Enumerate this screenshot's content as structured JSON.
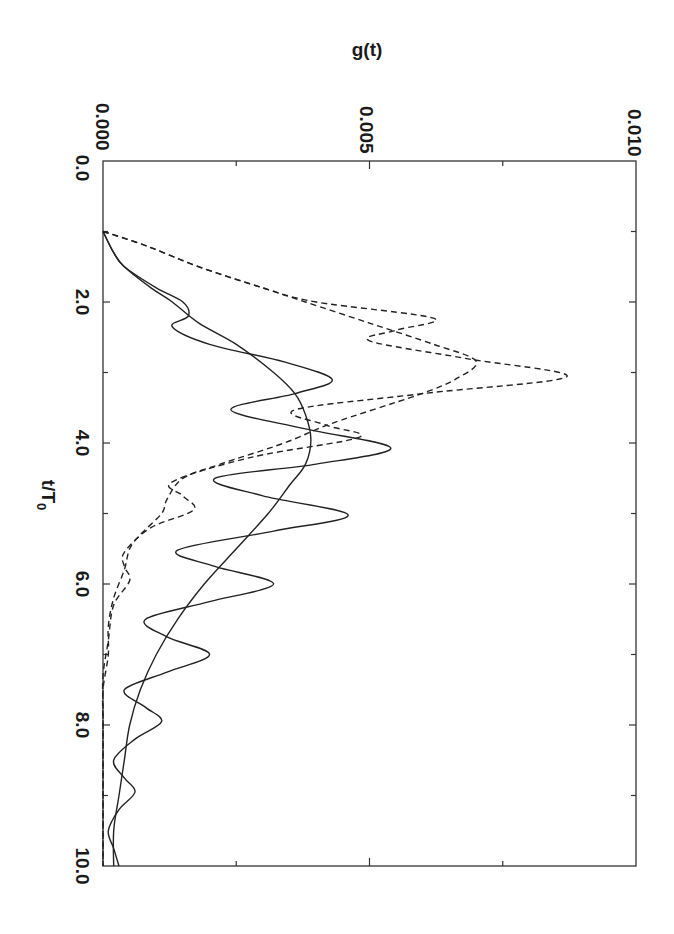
{
  "chart_data": {
    "type": "line",
    "orientation": "rotated-90-clockwise",
    "title": "",
    "xlabel": "t/T0",
    "ylabel": "g(t)",
    "xlim": [
      0.0,
      10.0
    ],
    "ylim": [
      0.0,
      0.01
    ],
    "x_tick_labels": [
      "0.0",
      "2.0",
      "4.0",
      "6.0",
      "8.0",
      "10.0"
    ],
    "x_ticks_minor": [
      1,
      3,
      5,
      7,
      9
    ],
    "y_tick_labels": [
      "0.000",
      "0.005",
      "0.010"
    ],
    "y_ticks_minor": [
      0.0025,
      0.0075
    ],
    "grid": false,
    "legend": null,
    "series": [
      {
        "name": "solid-oscillating",
        "style": "solid",
        "x": [
          1.0,
          1.3,
          1.5,
          1.8,
          2.0,
          2.2,
          2.35,
          2.6,
          2.85,
          3.1,
          3.3,
          3.53,
          3.8,
          4.07,
          4.3,
          4.5,
          4.75,
          5.02,
          5.25,
          5.52,
          5.75,
          6.0,
          6.25,
          6.5,
          6.75,
          7.0,
          7.25,
          7.5,
          7.75,
          7.95,
          8.2,
          8.5,
          8.75,
          8.95,
          9.2,
          9.5,
          9.75,
          10.0
        ],
        "y": [
          0.0,
          0.0002,
          0.0004,
          0.001,
          0.0015,
          0.0016,
          0.0013,
          0.002,
          0.0034,
          0.0043,
          0.0036,
          0.0024,
          0.0038,
          0.0054,
          0.004,
          0.0021,
          0.003,
          0.0046,
          0.0032,
          0.0014,
          0.0021,
          0.0032,
          0.002,
          0.0008,
          0.0012,
          0.002,
          0.0012,
          0.0004,
          0.0008,
          0.0011,
          0.0006,
          0.0002,
          0.0004,
          0.0006,
          0.0003,
          0.0001,
          0.0002,
          0.0003
        ]
      },
      {
        "name": "solid-smooth",
        "style": "solid",
        "x": [
          1.0,
          1.3,
          1.5,
          1.8,
          2.0,
          2.3,
          2.6,
          3.0,
          3.3,
          3.6,
          3.95,
          4.3,
          4.6,
          5.0,
          5.5,
          6.0,
          6.5,
          7.0,
          7.5,
          8.0,
          8.5,
          9.0,
          9.5,
          10.0
        ],
        "y": [
          0.0,
          0.0002,
          0.0004,
          0.0009,
          0.0013,
          0.0018,
          0.0025,
          0.0032,
          0.0036,
          0.0038,
          0.0039,
          0.0038,
          0.0035,
          0.0031,
          0.0025,
          0.0019,
          0.0014,
          0.001,
          0.0007,
          0.0005,
          0.0004,
          0.0003,
          0.0002,
          0.0002
        ]
      },
      {
        "name": "dashed-oscillating",
        "style": "dashed",
        "x": [
          1.0,
          1.2,
          1.5,
          1.8,
          2.0,
          2.23,
          2.4,
          2.55,
          2.8,
          3.06,
          3.3,
          3.53,
          3.75,
          3.92,
          4.2,
          4.55,
          4.75,
          4.95,
          5.2,
          5.55,
          5.75,
          5.95,
          6.3,
          6.8,
          7.3,
          7.8,
          8.5,
          9.0,
          10.0
        ],
        "y": [
          0.0,
          0.0008,
          0.0018,
          0.003,
          0.004,
          0.0062,
          0.0055,
          0.005,
          0.0068,
          0.0087,
          0.006,
          0.0036,
          0.0042,
          0.0048,
          0.0028,
          0.0013,
          0.0015,
          0.0017,
          0.0009,
          0.0004,
          0.0004,
          0.0005,
          0.0002,
          0.0001,
          0.0,
          0.0,
          0.0,
          0.0,
          0.0
        ]
      },
      {
        "name": "dashed-smooth",
        "style": "dashed",
        "x": [
          1.0,
          1.2,
          1.5,
          1.8,
          2.0,
          2.3,
          2.6,
          2.84,
          3.1,
          3.32,
          3.72,
          4.0,
          4.3,
          4.5,
          4.8,
          5.0,
          5.3,
          5.5,
          5.8,
          6.2,
          6.6,
          7.0,
          7.5,
          8.0,
          9.0,
          10.0
        ],
        "y": [
          0.0,
          0.0008,
          0.0018,
          0.003,
          0.0038,
          0.005,
          0.0062,
          0.007,
          0.0066,
          0.0059,
          0.0043,
          0.0034,
          0.0022,
          0.0015,
          0.0012,
          0.0011,
          0.0007,
          0.0005,
          0.0004,
          0.0002,
          0.0001,
          0.0001,
          0.0,
          0.0,
          0.0,
          0.0
        ]
      }
    ]
  },
  "labels": {
    "ylabel": "g(t)",
    "xlabel_main": "t/T",
    "xlabel_sub": "0",
    "y_ticks": [
      "0.000",
      "0.005",
      "0.010"
    ],
    "x_ticks": [
      "0.0",
      "2.0",
      "4.0",
      "6.0",
      "8.0",
      "10.0"
    ]
  }
}
